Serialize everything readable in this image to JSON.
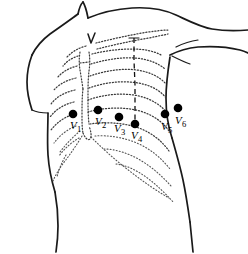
{
  "figure": {
    "background_color": "#ffffff",
    "outline_color": "#1a1a1a",
    "rib_color": "#3a3a3a",
    "electrode_color": "#000000"
  },
  "landmarks": {
    "suprasternal_notch_label": "V",
    "midclavicular_line_name": "midclavicular-line"
  },
  "electrodes": [
    {
      "id": "V1",
      "letter": "V",
      "subscript": "1",
      "dot_x": 73,
      "dot_y": 114,
      "label_x": 70,
      "label_y": 129
    },
    {
      "id": "V2",
      "letter": "V",
      "subscript": "2",
      "dot_x": 98,
      "dot_y": 110,
      "label_x": 95,
      "label_y": 125
    },
    {
      "id": "V3",
      "letter": "V",
      "subscript": "3",
      "dot_x": 119,
      "dot_y": 117,
      "label_x": 114,
      "label_y": 132
    },
    {
      "id": "V4",
      "letter": "V",
      "subscript": "4",
      "dot_x": 135,
      "dot_y": 124,
      "label_x": 131,
      "label_y": 139
    },
    {
      "id": "V5",
      "letter": "V",
      "subscript": "5",
      "dot_x": 165,
      "dot_y": 114,
      "label_x": 161,
      "label_y": 130
    },
    {
      "id": "V6",
      "letter": "V",
      "subscript": "6",
      "dot_x": 178,
      "dot_y": 108,
      "label_x": 175,
      "label_y": 124
    }
  ]
}
